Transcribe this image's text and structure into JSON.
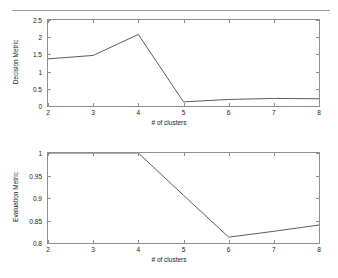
{
  "figure": {
    "background": "#ffffff",
    "line_color": "#4a4a4a",
    "axis_color": "#8e8e8e",
    "divider_color": "#9a9a9a"
  },
  "chart_data": [
    {
      "id": "decision-metric",
      "type": "line",
      "title": "",
      "xlabel": "# of clusters",
      "ylabel": "Decision Metric",
      "x": [
        2,
        3,
        4,
        5,
        6,
        7,
        8
      ],
      "values": [
        1.37,
        1.47,
        2.08,
        0.12,
        0.19,
        0.22,
        0.21
      ],
      "xlim": [
        2,
        8
      ],
      "ylim": [
        0,
        2.5
      ],
      "xticks": [
        2,
        3,
        4,
        5,
        6,
        7,
        8
      ],
      "xticklabels": [
        "2",
        "3",
        "4",
        "5",
        "6",
        "7",
        "8"
      ],
      "yticks": [
        0,
        0.5,
        1,
        1.5,
        2,
        2.5
      ],
      "yticklabels": [
        "0",
        "0.5",
        "1",
        "1.5",
        "2",
        "2.5"
      ],
      "grid": false,
      "legend": false
    },
    {
      "id": "evaluation-metric",
      "type": "line",
      "title": "",
      "xlabel": "# of clusters",
      "ylabel": "Evaluation Metric",
      "x": [
        2,
        3,
        4,
        5,
        6,
        7,
        8
      ],
      "values": [
        1.0,
        1.0,
        1.0,
        0.906,
        0.813,
        0.826,
        0.84
      ],
      "xlim": [
        2,
        8
      ],
      "ylim": [
        0.8,
        1.0
      ],
      "xticks": [
        2,
        3,
        4,
        5,
        6,
        7,
        8
      ],
      "xticklabels": [
        "2",
        "3",
        "4",
        "5",
        "6",
        "7",
        "8"
      ],
      "yticks": [
        0.8,
        0.85,
        0.9,
        0.95,
        1.0
      ],
      "yticklabels": [
        "0.8",
        "0.85",
        "0.9",
        "0.95",
        "1"
      ],
      "grid": false,
      "legend": false
    }
  ]
}
